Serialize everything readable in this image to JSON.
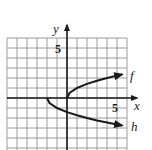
{
  "chart_data": {
    "type": "line",
    "title": "",
    "xlabel": "x",
    "ylabel": "y",
    "xlim": [
      -6,
      6
    ],
    "ylim": [
      -5,
      6
    ],
    "grid": true,
    "grid_step": 1,
    "tick_labels": {
      "x": [
        {
          "value": 5,
          "label": "5"
        }
      ],
      "y": [
        {
          "value": 5,
          "label": "5"
        }
      ]
    },
    "series": [
      {
        "name": "f",
        "label": "f",
        "description": "square root curve starting at origin, arrow to the right",
        "x": [
          0,
          0.25,
          1,
          2,
          3,
          4,
          5,
          5.5
        ],
        "y": [
          0,
          0.5,
          1,
          1.41,
          1.73,
          2,
          2.24,
          2.35
        ]
      },
      {
        "name": "h",
        "label": "h",
        "description": "negative square root curve starting at (-2, 0), arrow to the right",
        "x": [
          -2,
          -1.75,
          -1,
          0,
          1,
          2,
          3,
          4,
          5,
          5.5
        ],
        "y": [
          0,
          -0.5,
          -1,
          -1.41,
          -1.73,
          -2,
          -2.24,
          -2.45,
          -2.65,
          -2.74
        ]
      }
    ],
    "colors": {
      "grid": "#9a9a9a",
      "axis": "#1a1a1a",
      "curve": "#1a1a1a",
      "background": "#ffffff"
    }
  },
  "labels": {
    "x_axis": "x",
    "y_axis": "y",
    "x_tick_5": "5",
    "y_tick_5": "5",
    "curve_f": "f",
    "curve_h": "h"
  }
}
